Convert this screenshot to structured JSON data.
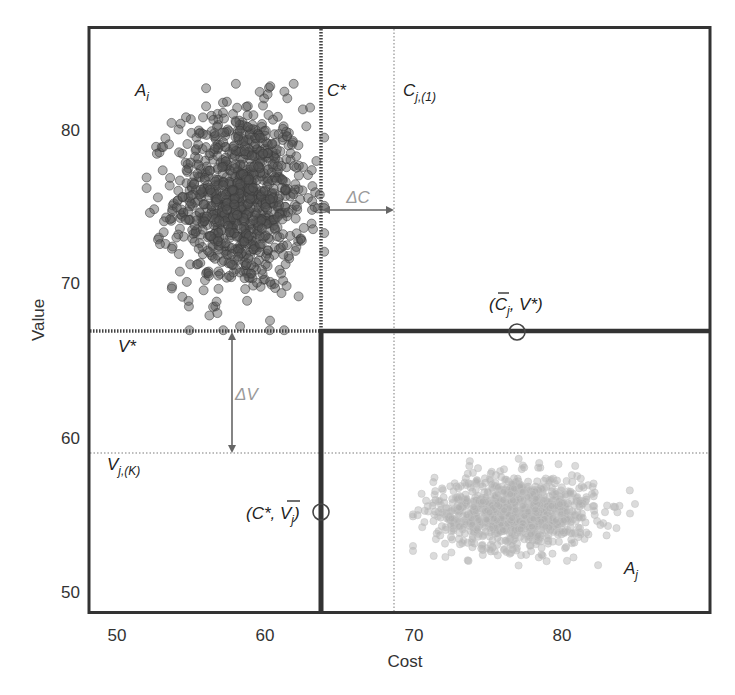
{
  "chart_data": {
    "type": "scatter",
    "title": "",
    "xlabel": "Cost",
    "ylabel": "Value",
    "xlim": [
      48.1,
      90.0
    ],
    "ylim": [
      48.7,
      86.7
    ],
    "x_ticks": [
      50,
      60,
      70,
      80
    ],
    "y_ticks": [
      50,
      60,
      70,
      80
    ],
    "grid": false,
    "legend": null,
    "series": [
      {
        "name": "A_i",
        "label": "A",
        "label_sub": "i",
        "color": "#555555",
        "fill_opacity": 0.45,
        "marker_radius": 4.5,
        "count": 1000,
        "distribution": "bivariate normal (approximate)",
        "mean": {
          "cost": 58.3,
          "value": 75.5
        },
        "std": {
          "cost": 2.2,
          "value": 3.0
        },
        "extent": {
          "cost": [
            52.0,
            64.0
          ],
          "value": [
            67.0,
            83.0
          ]
        }
      },
      {
        "name": "A_j",
        "label": "A",
        "label_sub": "j",
        "color": "#b0b0b0",
        "fill_opacity": 0.45,
        "marker_radius": 3.6,
        "count": 1000,
        "distribution": "bivariate normal (approximate)",
        "mean": {
          "cost": 76.9,
          "value": 55.2
        },
        "std": {
          "cost": 2.7,
          "value": 1.2
        },
        "extent": {
          "cost": [
            70.0,
            85.0
          ],
          "value": [
            51.5,
            58.7
          ]
        }
      }
    ],
    "reference_lines": [
      {
        "name": "C*",
        "orientation": "vertical",
        "value": 63.8,
        "style": "dotted-thick",
        "color": "#444444"
      },
      {
        "name": "C_j,(1)",
        "orientation": "vertical",
        "value": 68.7,
        "style": "dotted-light",
        "color": "#bbbbbb"
      },
      {
        "name": "V*",
        "orientation": "horizontal",
        "value": 66.9,
        "style": "dotted-thick",
        "color": "#444444"
      },
      {
        "name": "V_j,(K)",
        "orientation": "horizontal",
        "value": 59.0,
        "style": "dotted-light",
        "color": "#bbbbbb"
      }
    ],
    "frontier_lines": [
      {
        "description": "solid vertical at C* from V* down to bottom",
        "x": 63.8,
        "y_from": 66.9,
        "y_to": 48.7
      },
      {
        "description": "solid horizontal at V* from C* to right edge",
        "y": 66.9,
        "x_from": 63.8,
        "x_to": 90.0
      }
    ],
    "annotations": [
      {
        "text": "A_i",
        "cost": 51.2,
        "value": 77.6
      },
      {
        "text": "C*",
        "cost": 64.2,
        "value": 77.6
      },
      {
        "text": "C_j,(1)",
        "cost": 69.3,
        "value": 77.6
      },
      {
        "text": "V*",
        "cost": 50.1,
        "value": 65.6
      },
      {
        "text": "V_j,(K)",
        "cost": 49.3,
        "value": 57.8
      },
      {
        "text": "A_j",
        "cost": 84.3,
        "value": 52.4
      },
      {
        "text": "ΔC",
        "cost": 66.3,
        "value": 74.3,
        "color": "#9a9a9a"
      },
      {
        "text": "ΔV",
        "cost": 58.1,
        "value": 62.9,
        "color": "#9a9a9a"
      },
      {
        "text": "(C̄_j, V*)",
        "cost": 77.0,
        "value": 68.4
      },
      {
        "text": "(C*, V̄_j)",
        "cost": 60.2,
        "value": 54.8
      }
    ],
    "arrows": [
      {
        "name": "ΔC",
        "orientation": "horizontal",
        "value": 74.8,
        "from": 63.8,
        "to": 68.7,
        "double_headed": true,
        "color": "#666666"
      },
      {
        "name": "ΔV",
        "orientation": "vertical",
        "cost": 57.7,
        "from": 66.9,
        "to": 59.0,
        "double_headed": true,
        "color": "#666666"
      }
    ],
    "markers": [
      {
        "name": "(C̄_j, V*)",
        "cost": 77.0,
        "value": 66.9,
        "shape": "open-circle"
      },
      {
        "name": "(C*, V̄_j)",
        "cost": 63.8,
        "value": 55.2,
        "shape": "open-circle"
      }
    ]
  },
  "labels": {
    "xlabel": "Cost",
    "ylabel": "Value",
    "x_ticks": [
      "50",
      "60",
      "70",
      "80"
    ],
    "y_ticks": [
      "80",
      "70",
      "60",
      "50"
    ],
    "a_i": "A",
    "a_i_sub": "i",
    "a_j": "A",
    "a_j_sub": "j",
    "c_star": "C*",
    "c_j1": "C",
    "c_j1_sub": "j,(1)",
    "v_star": "V*",
    "v_jk": "V",
    "v_jk_sub": "j,(K)",
    "delta_c": "ΔC",
    "delta_v": "ΔV",
    "pt_cj_open": "(",
    "pt_cj_c": "C",
    "pt_cj_sub": "j",
    "pt_cj_rest": ", V*)",
    "pt_vj_open": "(C*, ",
    "pt_vj_v": "V",
    "pt_vj_sub": "j",
    "pt_vj_close": ")"
  }
}
